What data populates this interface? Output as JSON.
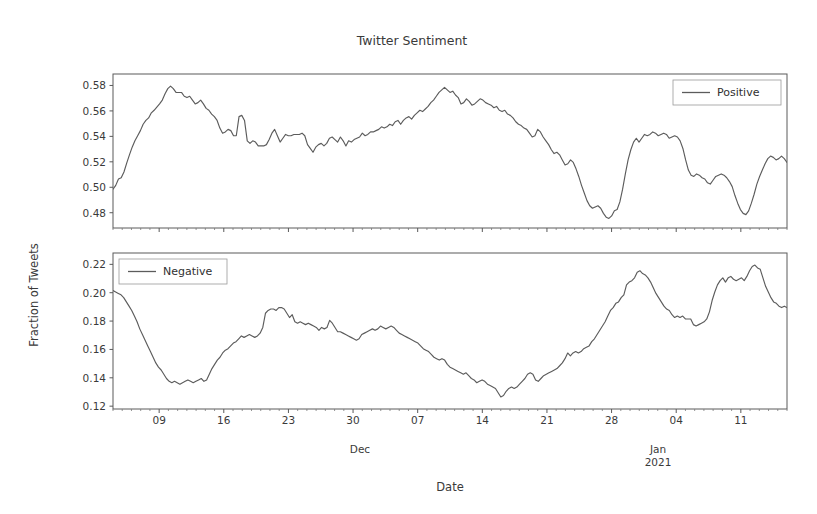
{
  "chart_data": {
    "type": "line",
    "title": "Twitter Sentiment",
    "xlabel": "Date",
    "ylabel": "Fraction of Tweets",
    "grid": false,
    "subplot_count": 2,
    "shared_x": true,
    "x_tick_labels": [
      "09",
      "16",
      "23",
      "30",
      "07",
      "14",
      "21",
      "28",
      "04",
      "11"
    ],
    "x_minor_group_labels": [
      "Dec",
      "Jan\n2021"
    ],
    "x_minor_group_label_1": "Dec",
    "x_minor_group_label_2a": "Jan",
    "x_minor_group_label_2b": "2021",
    "x_range_days": [
      0,
      73
    ],
    "x_tick_days": [
      5,
      12,
      19,
      26,
      33,
      40,
      47,
      54,
      61,
      68
    ],
    "line_color": "#5c5c5c",
    "subplots": [
      {
        "name": "positive",
        "legend_label": "Positive",
        "legend_position": "upper right",
        "ylim": [
          0.468,
          0.589
        ],
        "y_ticks": [
          0.48,
          0.5,
          0.52,
          0.54,
          0.56,
          0.58
        ],
        "y_tick_labels": [
          "0.48",
          "0.50",
          "0.52",
          "0.54",
          "0.56",
          "0.58"
        ],
        "values": [
          0.4985,
          0.5015,
          0.5065,
          0.5075,
          0.512,
          0.519,
          0.5255,
          0.5315,
          0.5365,
          0.5405,
          0.5445,
          0.5495,
          0.5525,
          0.5545,
          0.5585,
          0.5605,
          0.563,
          0.5655,
          0.5685,
          0.5735,
          0.5775,
          0.5795,
          0.5775,
          0.5745,
          0.5745,
          0.5745,
          0.5715,
          0.5705,
          0.5715,
          0.5685,
          0.5655,
          0.5665,
          0.5685,
          0.5655,
          0.562,
          0.5605,
          0.5575,
          0.5555,
          0.5525,
          0.5465,
          0.5425,
          0.5435,
          0.5455,
          0.5445,
          0.5405,
          0.5405,
          0.5555,
          0.5565,
          0.5525,
          0.5365,
          0.5345,
          0.5365,
          0.5355,
          0.5325,
          0.5325,
          0.5325,
          0.5335,
          0.5375,
          0.5425,
          0.5455,
          0.5405,
          0.5355,
          0.5385,
          0.5415,
          0.5405,
          0.5405,
          0.5415,
          0.5415,
          0.5415,
          0.5425,
          0.5405,
          0.5335,
          0.5305,
          0.5275,
          0.5315,
          0.5335,
          0.5345,
          0.5325,
          0.5345,
          0.5385,
          0.5395,
          0.5375,
          0.5355,
          0.5395,
          0.5365,
          0.5325,
          0.5365,
          0.5355,
          0.5375,
          0.5385,
          0.5395,
          0.5425,
          0.5405,
          0.5415,
          0.5435,
          0.5435,
          0.5445,
          0.5455,
          0.5475,
          0.5465,
          0.5475,
          0.5495,
          0.5485,
          0.5515,
          0.5525,
          0.5495,
          0.5525,
          0.5545,
          0.5555,
          0.5535,
          0.5565,
          0.5585,
          0.5605,
          0.5595,
          0.5615,
          0.5635,
          0.5665,
          0.5685,
          0.5715,
          0.5745,
          0.5765,
          0.5785,
          0.5765,
          0.5745,
          0.5755,
          0.5725,
          0.5705,
          0.5655,
          0.5665,
          0.5695,
          0.5675,
          0.5645,
          0.5655,
          0.5675,
          0.5695,
          0.5685,
          0.5665,
          0.5655,
          0.5645,
          0.5625,
          0.5635,
          0.5605,
          0.5595,
          0.5605,
          0.5575,
          0.5565,
          0.5545,
          0.5515,
          0.5495,
          0.5485,
          0.5465,
          0.5455,
          0.5425,
          0.5395,
          0.5405,
          0.5455,
          0.5435,
          0.5395,
          0.5365,
          0.5335,
          0.5295,
          0.5265,
          0.5275,
          0.5255,
          0.5215,
          0.5175,
          0.5185,
          0.5215,
          0.5195,
          0.5145,
          0.5085,
          0.5015,
          0.4955,
          0.4895,
          0.4855,
          0.4835,
          0.4845,
          0.4855,
          0.4835,
          0.4795,
          0.4765,
          0.4755,
          0.4775,
          0.4815,
          0.4825,
          0.4885,
          0.4985,
          0.5105,
          0.5215,
          0.5295,
          0.5355,
          0.5385,
          0.5355,
          0.5385,
          0.5415,
          0.5405,
          0.5415,
          0.5435,
          0.5425,
          0.5405,
          0.5415,
          0.5425,
          0.5415,
          0.5385,
          0.5395,
          0.5405,
          0.5395,
          0.5365,
          0.5305,
          0.5215,
          0.5135,
          0.5095,
          0.5085,
          0.5105,
          0.5095,
          0.5075,
          0.5065,
          0.5035,
          0.5025,
          0.5055,
          0.5085,
          0.5095,
          0.5105,
          0.5095,
          0.5075,
          0.5045,
          0.5005,
          0.4935,
          0.4875,
          0.4825,
          0.4795,
          0.4785,
          0.4815,
          0.4875,
          0.4945,
          0.5025,
          0.5085,
          0.5135,
          0.5185,
          0.5225,
          0.5245,
          0.5235,
          0.5215,
          0.5225,
          0.5245,
          0.5225,
          0.5195
        ]
      },
      {
        "name": "negative",
        "legend_label": "Negative",
        "legend_position": "upper left",
        "ylim": [
          0.118,
          0.228
        ],
        "y_ticks": [
          0.12,
          0.14,
          0.16,
          0.18,
          0.2,
          0.22
        ],
        "y_tick_labels": [
          "0.12",
          "0.14",
          "0.16",
          "0.18",
          "0.20",
          "0.22"
        ],
        "values": [
          0.2015,
          0.2005,
          0.1995,
          0.1985,
          0.1965,
          0.1935,
          0.1905,
          0.1875,
          0.1835,
          0.1795,
          0.1745,
          0.1705,
          0.1665,
          0.1625,
          0.1585,
          0.1545,
          0.1505,
          0.1475,
          0.1455,
          0.1425,
          0.1395,
          0.1375,
          0.1365,
          0.1375,
          0.1365,
          0.1355,
          0.1365,
          0.1375,
          0.1385,
          0.1375,
          0.1365,
          0.1375,
          0.1385,
          0.1395,
          0.1375,
          0.1385,
          0.1425,
          0.1465,
          0.1495,
          0.1525,
          0.1545,
          0.1575,
          0.1595,
          0.1605,
          0.1625,
          0.1645,
          0.1655,
          0.1675,
          0.1695,
          0.1685,
          0.1695,
          0.1705,
          0.1695,
          0.1685,
          0.1695,
          0.1715,
          0.1755,
          0.1855,
          0.1875,
          0.1885,
          0.1885,
          0.1875,
          0.1895,
          0.1895,
          0.1885,
          0.1855,
          0.1825,
          0.1845,
          0.1795,
          0.1785,
          0.1795,
          0.1785,
          0.1775,
          0.1785,
          0.1775,
          0.1765,
          0.1755,
          0.1735,
          0.1755,
          0.1745,
          0.1755,
          0.1805,
          0.1785,
          0.1755,
          0.1725,
          0.1725,
          0.1715,
          0.1705,
          0.1695,
          0.1685,
          0.1675,
          0.1665,
          0.1675,
          0.1705,
          0.1715,
          0.1725,
          0.1735,
          0.1745,
          0.1735,
          0.1745,
          0.1765,
          0.1755,
          0.1745,
          0.1755,
          0.1765,
          0.1755,
          0.1735,
          0.1715,
          0.1705,
          0.1695,
          0.1685,
          0.1675,
          0.1665,
          0.1655,
          0.1645,
          0.1625,
          0.1605,
          0.1595,
          0.1585,
          0.1565,
          0.1545,
          0.1535,
          0.1525,
          0.1535,
          0.1525,
          0.1495,
          0.1475,
          0.1465,
          0.1455,
          0.1445,
          0.1435,
          0.1425,
          0.1435,
          0.1415,
          0.1395,
          0.1385,
          0.1365,
          0.1375,
          0.1385,
          0.1375,
          0.1355,
          0.1345,
          0.1335,
          0.1325,
          0.1295,
          0.1265,
          0.1275,
          0.1305,
          0.1325,
          0.1335,
          0.1325,
          0.1335,
          0.1355,
          0.1375,
          0.1395,
          0.1425,
          0.1435,
          0.1425,
          0.1385,
          0.1375,
          0.1395,
          0.1415,
          0.1425,
          0.1435,
          0.1445,
          0.1455,
          0.1465,
          0.1485,
          0.1505,
          0.1535,
          0.1575,
          0.1555,
          0.1575,
          0.1585,
          0.1575,
          0.1585,
          0.1605,
          0.1615,
          0.1625,
          0.1655,
          0.1675,
          0.1705,
          0.1735,
          0.1765,
          0.1795,
          0.1835,
          0.1875,
          0.1895,
          0.1925,
          0.1935,
          0.1965,
          0.1985,
          0.2055,
          0.2075,
          0.2085,
          0.2105,
          0.2145,
          0.2155,
          0.2135,
          0.2125,
          0.2105,
          0.2075,
          0.2035,
          0.1995,
          0.1965,
          0.1935,
          0.1905,
          0.1885,
          0.1875,
          0.1845,
          0.1825,
          0.1835,
          0.1825,
          0.1835,
          0.1815,
          0.1815,
          0.1815,
          0.1775,
          0.1765,
          0.1775,
          0.1785,
          0.1795,
          0.1815,
          0.1865,
          0.1945,
          0.2005,
          0.2055,
          0.2085,
          0.2105,
          0.2075,
          0.2105,
          0.2115,
          0.2095,
          0.2085,
          0.2095,
          0.2105,
          0.2085,
          0.2115,
          0.2155,
          0.2185,
          0.2195,
          0.2175,
          0.2165,
          0.2105,
          0.2045,
          0.2005,
          0.1965,
          0.1935,
          0.1925,
          0.1905,
          0.1895,
          0.1905,
          0.1895
        ]
      }
    ]
  }
}
